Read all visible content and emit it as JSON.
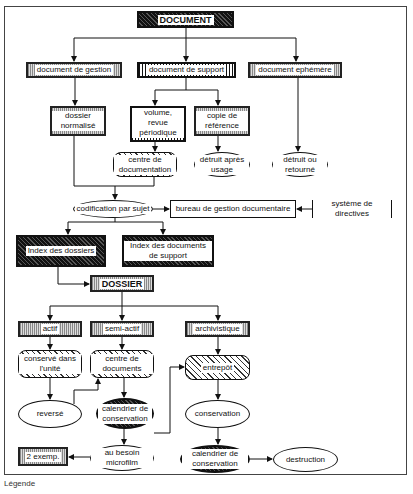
{
  "diagram": {
    "nodes": {
      "document": "DOCUMENT",
      "doc_gestion": "document de gestion",
      "doc_support": "document de support",
      "doc_ephemere": "document ephémère",
      "dossier_normalise": "dossier normalisé",
      "volume_revue": "volume, revue périodique",
      "copie_reference": "copie de référence",
      "centre_documentation": "centre de documentation",
      "detruit_apres_usage": "détruit après usage",
      "detruit_ou_retourne": "détruit ou retourné",
      "codification": "codification par sujet",
      "bureau_gestion": "bureau de gestion documentaire",
      "systeme_directives": "système de directives",
      "index_dossiers": "Index des dossiers",
      "index_documents_support": "Index des documents de support",
      "dossier": "DOSSIER",
      "actif": "actif",
      "semi_actif": "semi-actif",
      "archivistique": "archivistique",
      "conserve_unite": "conservé dans l'unité",
      "centre_documents": "centre de documents",
      "entrepot": "entrepôt",
      "reverse": "reversé",
      "calendrier_1": "calendrier de conservation",
      "conservation": "conservation",
      "deux_exemp": "2 exemp.",
      "au_besoin_microfilm": "au besoin microfilm",
      "calendrier_2": "calendrier de conservation",
      "destruction": "destruction"
    },
    "legend_label": "Légende"
  }
}
